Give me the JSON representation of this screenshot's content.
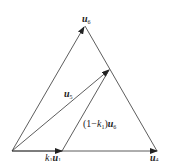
{
  "diagram": {
    "type": "vector-triangle",
    "colors": {
      "line": "#333333",
      "background": "#ffffff",
      "text": "#222222"
    },
    "points": {
      "origin": [
        12,
        151
      ],
      "apex": [
        85,
        26
      ],
      "right": [
        157,
        151
      ],
      "k1u1": [
        62,
        151
      ],
      "u5_tip": [
        110,
        69
      ]
    },
    "labels": {
      "u6": {
        "base": "u",
        "sub": "6"
      },
      "u5": {
        "base": "u",
        "sub": "5"
      },
      "u4": {
        "base": "u",
        "sub": "4"
      },
      "k1u1": {
        "k": "k",
        "ksub": "1",
        "base": "u",
        "sub": "1"
      },
      "one_minus_k1_u6": {
        "prefix": "(1−",
        "k": "k",
        "ksub": "1",
        "close": ")",
        "base": "u",
        "sub": "6"
      }
    }
  }
}
